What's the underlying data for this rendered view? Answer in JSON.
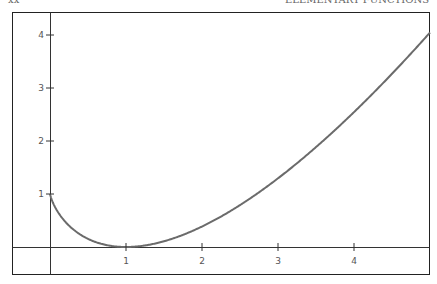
{
  "header": {
    "left_text": "xx",
    "right_text": "ELEMENTARY FUNCTIONS"
  },
  "chart_data": {
    "type": "line",
    "title": "",
    "xlabel": "",
    "ylabel": "",
    "function": "x*ln(x) - x + 1",
    "x": [
      0,
      0.25,
      0.5,
      0.75,
      1,
      1.5,
      2,
      2.5,
      3,
      3.5,
      4,
      4.5,
      5
    ],
    "series": [
      {
        "name": "f(x)",
        "values": [
          1,
          0.403,
          0.153,
          0.034,
          0,
          0.108,
          0.386,
          0.791,
          1.296,
          1.885,
          2.545,
          3.268,
          4.047
        ]
      }
    ],
    "xticks": [
      "1",
      "2",
      "3",
      "4"
    ],
    "yticks": [
      "1",
      "2",
      "3",
      "4"
    ],
    "xlim": [
      -0.5,
      5
    ],
    "ylim": [
      -0.5,
      4.4
    ],
    "grid": false,
    "legend": null,
    "colors": {
      "curve": "#6b6b6b",
      "axes": "#333333",
      "frame": "#222222"
    }
  }
}
